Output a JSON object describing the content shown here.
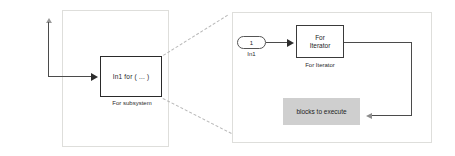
{
  "diagram": {
    "colors": {
      "panel_border": "#dededb",
      "block_border": "#2a2a2a",
      "wire": "#4b4b4b",
      "gray_box_fill": "#cfcfcf",
      "dashed_leader": "#b9b9b9",
      "background": "#ffffff"
    },
    "left_panel": {
      "name": "for-subsystem-panel",
      "block": {
        "label": "In1  for ( ... )",
        "caption": "For subsystem"
      },
      "feedback_wire": {
        "name": "input-feedback-wire",
        "has_up_arrow": true,
        "has_right_arrow": true
      }
    },
    "right_panel": {
      "name": "for-subsystem-contents-panel",
      "input_port": {
        "number": "1",
        "caption": "In1"
      },
      "iterator_block": {
        "label_line_1": "For",
        "label_line_2": "Iterator",
        "caption": "For Iterator"
      },
      "gray_box": {
        "label": "blocks to execute"
      },
      "loop_wire": {
        "name": "iteration-loop-wire",
        "has_left_arrow": true
      }
    },
    "leaders": {
      "top": "dashed-expansion-leader-top",
      "bottom": "dashed-expansion-leader-bottom"
    }
  }
}
